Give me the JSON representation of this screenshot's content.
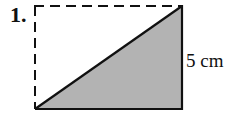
{
  "problem": {
    "number": "1.",
    "side_label": "5 cm"
  },
  "figure": {
    "shape": "rectangle with diagonal",
    "dashed_edges": [
      "top",
      "left"
    ],
    "solid_edges": [
      "bottom",
      "right",
      "diagonal"
    ],
    "shaded_region": "lower-right triangle",
    "shade_color": "#b3b3b3",
    "line_color": "#111111"
  }
}
